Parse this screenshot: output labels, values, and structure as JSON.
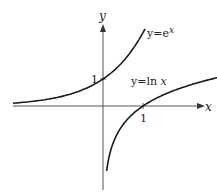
{
  "figure": {
    "x_axis_label": "x",
    "y_axis_label": "y",
    "y_tick_label": "1",
    "x_tick_label": "1",
    "curves": [
      {
        "name": "exp",
        "label_prefix": "y=e",
        "label_sup": "x",
        "function": "e^x"
      },
      {
        "name": "ln",
        "label": "y=ln x",
        "label_prefix": "y=ln ",
        "label_var": "x",
        "function": "ln x"
      }
    ],
    "colors": {
      "curve": "#1a1a1a",
      "axis": "#555555",
      "background": "#ffffff"
    }
  },
  "chart_data": {
    "type": "line",
    "title": "",
    "xlabel": "x",
    "ylabel": "y",
    "series": [
      {
        "name": "y=e^x",
        "x": [
          -2.4,
          -2,
          -1,
          0,
          0.5,
          1,
          1.1
        ],
        "values": [
          0.09,
          0.14,
          0.37,
          1,
          1.65,
          2.72,
          3.0
        ]
      },
      {
        "name": "y=ln x",
        "x": [
          0.09,
          0.5,
          1,
          2,
          3,
          4.1
        ],
        "values": [
          -2.4,
          -0.69,
          0,
          0.69,
          1.1,
          1.41
        ]
      }
    ],
    "annotations": [
      "1 on y-axis at (0,1)",
      "1 on x-axis at (1,0)"
    ],
    "grid": false,
    "legend": "inline labels"
  }
}
